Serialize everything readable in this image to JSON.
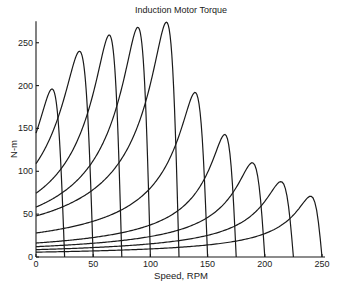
{
  "chart_data": {
    "type": "line",
    "title": "Induction Motor Torque",
    "xlabel": "Speed, RPM",
    "ylabel": "N-m",
    "xlim": [
      0,
      250
    ],
    "ylim": [
      0,
      275
    ],
    "xticks": [
      0,
      50,
      100,
      150,
      200,
      250
    ],
    "yticks": [
      0,
      50,
      100,
      150,
      200,
      250
    ],
    "grid": false,
    "legend": null,
    "series": [
      {
        "name": "curve 1",
        "sync_rpm": 25,
        "start_torque": 148,
        "peak_torque": 196,
        "peak_rpm": 14
      },
      {
        "name": "curve 2",
        "sync_rpm": 50,
        "start_torque": 105,
        "peak_torque": 240,
        "peak_rpm": 38
      },
      {
        "name": "curve 3",
        "sync_rpm": 75,
        "start_torque": 76,
        "peak_torque": 259,
        "peak_rpm": 64
      },
      {
        "name": "curve 4",
        "sync_rpm": 100,
        "start_torque": 60,
        "peak_torque": 268,
        "peak_rpm": 89
      },
      {
        "name": "curve 5",
        "sync_rpm": 125,
        "start_torque": 50,
        "peak_torque": 274,
        "peak_rpm": 114
      },
      {
        "name": "curve 6",
        "sync_rpm": 150,
        "start_torque": 28,
        "peak_torque": 192,
        "peak_rpm": 139
      },
      {
        "name": "curve 7",
        "sync_rpm": 175,
        "start_torque": 17,
        "peak_torque": 143,
        "peak_rpm": 165
      },
      {
        "name": "curve 8",
        "sync_rpm": 200,
        "start_torque": 12,
        "peak_torque": 110,
        "peak_rpm": 189
      },
      {
        "name": "curve 9",
        "sync_rpm": 225,
        "start_torque": 9,
        "peak_torque": 88,
        "peak_rpm": 214
      },
      {
        "name": "curve 10",
        "sync_rpm": 250,
        "start_torque": 6,
        "peak_torque": 71,
        "peak_rpm": 240
      }
    ]
  },
  "layout": {
    "x0_px": 36,
    "x_scale": 1.144,
    "y0_px": 257,
    "y_scale": 0.857
  }
}
